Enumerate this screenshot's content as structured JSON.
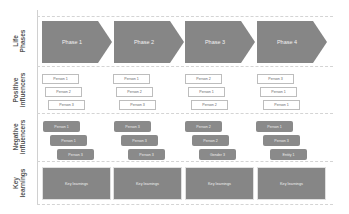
{
  "diagram": {
    "row_labels": [
      "Life\nPhases",
      "Positive\ninfluencers",
      "Negative\ninfluencers",
      "Key\nlearnings"
    ],
    "phases": [
      "Phase 1",
      "Phase 2",
      "Phase 3",
      "Phase 4"
    ],
    "positive_influencers": [
      [
        "Person 1",
        "Person 2",
        "Person 3"
      ],
      [
        "Person 1",
        "Person 2",
        "Person 3"
      ],
      [
        "Person 2",
        "Person 1",
        "Person 2"
      ],
      [
        "Person 3",
        "Person 1",
        "Person 1"
      ]
    ],
    "negative_influencers": [
      [
        "Person 1",
        "Person 1",
        "Person 3"
      ],
      [
        "Person 3",
        "Person 3",
        "Person 3"
      ],
      [
        "Person 2",
        "Person 2",
        "Gender 3"
      ],
      [
        "Person 1",
        "Person 3",
        "Entity 1"
      ]
    ],
    "key_learnings": [
      "Key learnings",
      "Key learnings",
      "Key learnings",
      "Key learnings"
    ],
    "colors": {
      "arrow_fill": "#868686",
      "negative_fill": "#8a8a8a",
      "positive_border": "#bdbdbd",
      "divider": "#d4d4d4"
    }
  }
}
